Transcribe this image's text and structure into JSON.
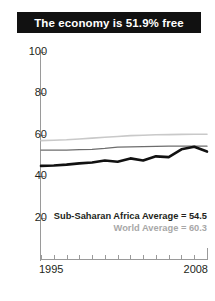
{
  "title": "The economy is 51.9% free",
  "chart_data": {
    "type": "line",
    "title": "The economy is 51.9% free",
    "xlabel": "",
    "ylabel": "",
    "xlim": [
      1995,
      2008
    ],
    "ylim": [
      0,
      100
    ],
    "yticks": [
      100,
      80,
      60,
      40,
      20
    ],
    "xticks": [
      1995,
      1996,
      1997,
      1998,
      1999,
      2000,
      2001,
      2002,
      2003,
      2004,
      2005,
      2006,
      2007,
      2008
    ],
    "xtick_labels_shown": [
      "1995",
      "2008"
    ],
    "grid": false,
    "legend_position": "inside-lower-right",
    "x": [
      1995,
      1996,
      1997,
      1998,
      1999,
      2000,
      2001,
      2002,
      2003,
      2004,
      2005,
      2006,
      2007,
      2008
    ],
    "series": [
      {
        "name": "Sub-Saharan Africa country",
        "color": "#111111",
        "width": 2.6,
        "values": [
          45.0,
          45.2,
          45.6,
          46.2,
          46.6,
          47.6,
          47.0,
          48.6,
          47.6,
          49.6,
          49.2,
          53.0,
          54.2,
          51.9
        ]
      },
      {
        "name": "Sub-Saharan Africa Average",
        "color": "#6d6d6d",
        "width": 1.3,
        "values": [
          52.6,
          52.6,
          52.6,
          52.8,
          53.0,
          53.4,
          54.0,
          54.2,
          54.3,
          54.4,
          54.5,
          54.5,
          54.5,
          54.5
        ]
      },
      {
        "name": "World Average",
        "color": "#c9c9c9",
        "width": 1.6,
        "values": [
          57.2,
          57.4,
          57.6,
          58.0,
          58.4,
          58.8,
          59.2,
          59.6,
          59.8,
          60.0,
          60.1,
          60.2,
          60.3,
          60.3
        ]
      }
    ],
    "annotations": [
      "Sub-Saharan Africa Average = 54.5",
      "World Average = 60.3"
    ]
  },
  "legend": {
    "region": "Sub-Saharan Africa Average = 54.5",
    "world": "World Average = 60.3"
  },
  "axis": {
    "x_start_label": "1995",
    "x_end_label": "2008"
  },
  "colors": {
    "banner_bg": "#111111",
    "banner_text": "#ffffff",
    "series_country": "#111111",
    "series_region": "#6d6d6d",
    "series_world": "#c9c9c9",
    "axis": "#9a9a9a",
    "tick_text": "#231f20"
  }
}
